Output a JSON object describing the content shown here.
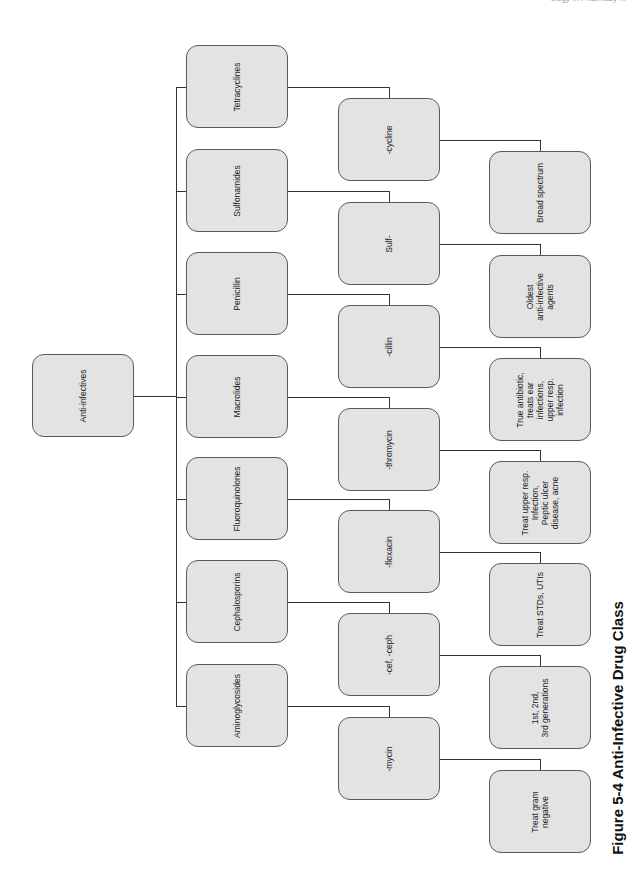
{
  "header": {
    "running_text": "ology ... Pharmacy ..."
  },
  "caption": "Figure 5-4  Anti-Infective Drug Class",
  "root": {
    "label": "Anti-infectives"
  },
  "classes": [
    {
      "name": "Tetracyclines",
      "suffix": "-cycline",
      "note": "Broad spectrum"
    },
    {
      "name": "Sulfonamides",
      "suffix": "Sulf-",
      "note": "Oldest\nanti-infective\nagents"
    },
    {
      "name": "Penicillin",
      "suffix": "-cillin",
      "note": "True antibiotic,\ntreats ear\ninfections,\nupper resp.\ninfection"
    },
    {
      "name": "Macrolides",
      "suffix": "-thromycin",
      "note": "Treat upper resp.\nInfection,\nPeptic ulcer\ndisease, acne"
    },
    {
      "name": "Fluoroquinolones",
      "suffix": "-floxacin",
      "note": "Treat STDs, UTIs"
    },
    {
      "name": "Cephalosporins",
      "suffix": "-cef, -ceph",
      "note": "1st, 2nd,\n3rd generations"
    },
    {
      "name": "Aminoglycosides",
      "suffix": "-mycin",
      "note": "Treat gram\nnegative"
    }
  ],
  "colors": {
    "box_fill": "#e3e3e3",
    "box_border": "#5a5a5a",
    "line": "#333333"
  }
}
